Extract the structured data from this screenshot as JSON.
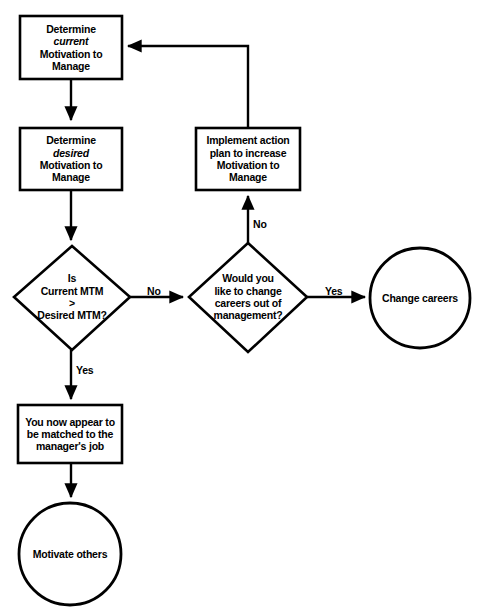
{
  "diagram": {
    "type": "flowchart",
    "colors": {
      "background": "#ffffff",
      "stroke": "#000000",
      "text": "#000000"
    },
    "nodes": {
      "determine_current": {
        "shape": "rectangle",
        "line1": "Determine",
        "line2_italic": "current",
        "line3": "Motivation to",
        "line4": "Manage"
      },
      "determine_desired": {
        "shape": "rectangle",
        "line1": "Determine",
        "line2_italic": "desired",
        "line3": "Motivation to",
        "line4": "Manage"
      },
      "implement_action": {
        "shape": "rectangle",
        "line1": "Implement action",
        "line2": "plan to increase",
        "line3": "Motivation to",
        "line4": "Manage"
      },
      "decision_mtm": {
        "shape": "diamond",
        "line1": "Is",
        "line2": "Current MTM",
        "line3": ">",
        "line4": "Desired MTM?"
      },
      "decision_careers": {
        "shape": "diamond",
        "line1": "Would you",
        "line2": "like to change",
        "line3": "careers out of",
        "line4": "management?"
      },
      "box_matched": {
        "shape": "rectangle",
        "line1": "You now appear to",
        "line2": "be matched to the",
        "line3": "manager's job"
      },
      "circle_motivate": {
        "shape": "circle",
        "label": "Motivate others"
      },
      "circle_change": {
        "shape": "circle",
        "label": "Change careers"
      }
    },
    "edges": {
      "no_horizontal": "No",
      "yes_right": "Yes",
      "no_vertical": "No",
      "yes_down": "Yes"
    }
  }
}
